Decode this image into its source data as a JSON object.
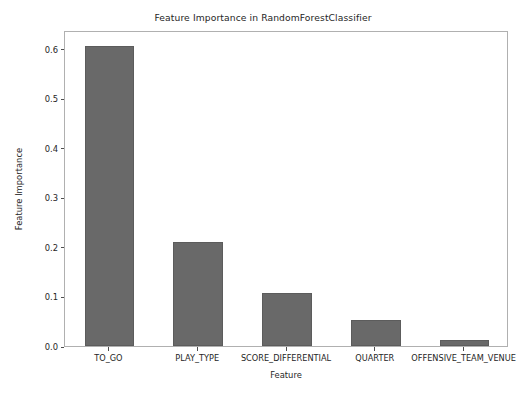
{
  "chart_data": {
    "type": "bar",
    "title": "Feature Importance in RandomForestClassifier",
    "xlabel": "Feature",
    "ylabel": "Feature Importance",
    "categories": [
      "TO_GO",
      "PLAY_TYPE",
      "SCORE_DIFFERENTIAL",
      "QUARTER",
      "OFFENSIVE_TEAM_VENUE"
    ],
    "values": [
      0.605,
      0.209,
      0.107,
      0.052,
      0.013
    ],
    "ylim": [
      0.0,
      0.638
    ],
    "yticks": [
      0.0,
      0.1,
      0.2,
      0.3,
      0.4,
      0.5,
      0.6
    ],
    "ytick_labels": [
      "0.0",
      "0.1",
      "0.2",
      "0.3",
      "0.4",
      "0.5",
      "0.6"
    ],
    "grid": false,
    "legend": null,
    "bar_color": "#696969",
    "bar_edge_color": "#5c5c5c",
    "axes_color": "#b0b0b0",
    "text_color": "#262626"
  }
}
